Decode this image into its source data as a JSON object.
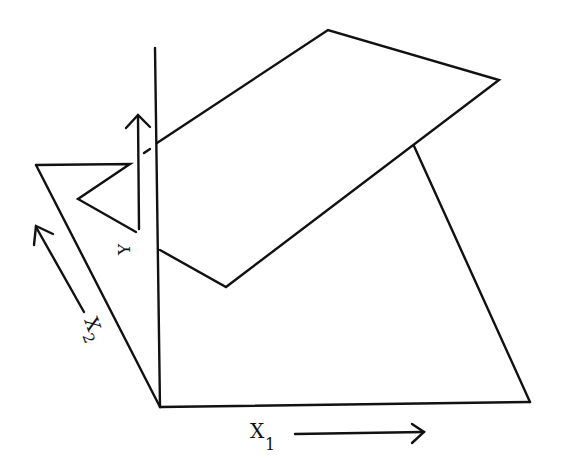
{
  "figure": {
    "stroke_color": "#111111",
    "background": "#ffffff"
  },
  "labels": {
    "y_axis": "Y",
    "x1_axis": "X",
    "x1_sub": "1",
    "x2_axis": "X",
    "x2_sub": "2"
  }
}
